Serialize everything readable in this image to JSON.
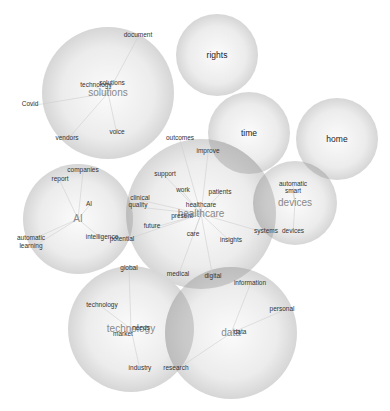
{
  "diagram": {
    "type": "bubble-cluster-network",
    "colors": {
      "background": "#ffffff",
      "bubble_fill_center": "#f7f7f7",
      "bubble_fill_edge": "#d8d8d8",
      "bubble_overlap": "#a0a0a0",
      "link": "#cfcfcf",
      "term_text": "#333333",
      "cluster_label_text": "#888888"
    },
    "clusters": [
      {
        "id": "solutions",
        "label": "solutions",
        "cx": 108,
        "cy": 93,
        "r": 66,
        "terms": [
          {
            "label": "document",
            "x": 138,
            "y": 37
          },
          {
            "label": "technology",
            "x": 96,
            "y": 87
          },
          {
            "label": "solutions",
            "x": 112,
            "y": 85
          },
          {
            "label": "Covid",
            "x": 30,
            "y": 106
          },
          {
            "label": "voice",
            "x": 117,
            "y": 134
          },
          {
            "label": "vendors",
            "x": 67,
            "y": 140
          }
        ]
      },
      {
        "id": "rights",
        "label": "rights",
        "cx": 217,
        "cy": 55,
        "r": 41,
        "terms": []
      },
      {
        "id": "time",
        "label": "time",
        "cx": 249,
        "cy": 133,
        "r": 41,
        "terms": []
      },
      {
        "id": "home",
        "label": "home",
        "cx": 337,
        "cy": 139,
        "r": 41,
        "terms": []
      },
      {
        "id": "ai",
        "label": "AI",
        "cx": 78,
        "cy": 219,
        "r": 55,
        "terms": [
          {
            "label": "companies",
            "x": 83,
            "y": 172
          },
          {
            "label": "report",
            "x": 60,
            "y": 181
          },
          {
            "label": "AI",
            "x": 89,
            "y": 206
          },
          {
            "label": "automatic",
            "x": 31,
            "y": 240
          },
          {
            "label": "learning",
            "x": 31,
            "y": 248
          },
          {
            "label": "intelligence",
            "x": 102,
            "y": 239
          }
        ]
      },
      {
        "id": "healthcare",
        "label": "healthcare",
        "cx": 201,
        "cy": 214,
        "r": 75,
        "terms": [
          {
            "label": "outcomes",
            "x": 180,
            "y": 140
          },
          {
            "label": "improve",
            "x": 208,
            "y": 153
          },
          {
            "label": "support",
            "x": 165,
            "y": 176
          },
          {
            "label": "work",
            "x": 183,
            "y": 192
          },
          {
            "label": "patients",
            "x": 220,
            "y": 194
          },
          {
            "label": "clinical",
            "x": 140,
            "y": 200
          },
          {
            "label": "quality",
            "x": 138,
            "y": 207
          },
          {
            "label": "healthcare",
            "x": 201,
            "y": 207
          },
          {
            "label": "present",
            "x": 182,
            "y": 218
          },
          {
            "label": "future",
            "x": 152,
            "y": 228
          },
          {
            "label": "potential",
            "x": 122,
            "y": 241
          },
          {
            "label": "care",
            "x": 193,
            "y": 236
          },
          {
            "label": "insights",
            "x": 231,
            "y": 242
          },
          {
            "label": "systems",
            "x": 266,
            "y": 233
          },
          {
            "label": "medical",
            "x": 178,
            "y": 276
          },
          {
            "label": "digital",
            "x": 213,
            "y": 278
          }
        ]
      },
      {
        "id": "devices",
        "label": "devices",
        "cx": 295,
        "cy": 203,
        "r": 42,
        "terms": [
          {
            "label": "automatic",
            "x": 293,
            "y": 186
          },
          {
            "label": "smart",
            "x": 293,
            "y": 193
          },
          {
            "label": "devices",
            "x": 293,
            "y": 233
          }
        ]
      },
      {
        "id": "technology",
        "label": "technology",
        "cx": 131,
        "cy": 329,
        "r": 63,
        "terms": [
          {
            "label": "global",
            "x": 129,
            "y": 270
          },
          {
            "label": "technology",
            "x": 102,
            "y": 307
          },
          {
            "label": "needs",
            "x": 141,
            "y": 330
          },
          {
            "label": "market",
            "x": 123,
            "y": 336
          },
          {
            "label": "industry",
            "x": 140,
            "y": 370
          }
        ]
      },
      {
        "id": "data",
        "label": "data",
        "cx": 231,
        "cy": 333,
        "r": 66,
        "terms": [
          {
            "label": "information",
            "x": 250,
            "y": 285
          },
          {
            "label": "personal",
            "x": 282,
            "y": 311
          },
          {
            "label": "data",
            "x": 240,
            "y": 334
          },
          {
            "label": "research",
            "x": 176,
            "y": 370
          }
        ]
      }
    ],
    "overlaps": [
      {
        "between": [
          "healthcare",
          "time"
        ]
      },
      {
        "between": [
          "healthcare",
          "devices"
        ]
      },
      {
        "between": [
          "healthcare",
          "ai"
        ]
      },
      {
        "between": [
          "healthcare",
          "data"
        ]
      },
      {
        "between": [
          "technology",
          "data"
        ]
      },
      {
        "between": [
          "home",
          "devices"
        ]
      }
    ]
  }
}
